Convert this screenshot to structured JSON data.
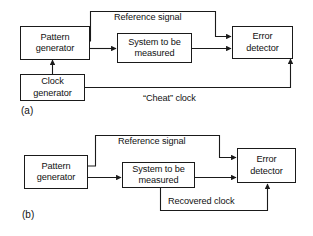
{
  "figure": {
    "title_visible": false,
    "panels": [
      {
        "id": "a",
        "label": "(a)",
        "blocks": [
          {
            "name": "pattern-generator",
            "lines": [
              "Pattern",
              "generator"
            ]
          },
          {
            "name": "system-under-test",
            "lines": [
              "System to be",
              "measured"
            ]
          },
          {
            "name": "error-detector",
            "lines": [
              "Error",
              "detector"
            ]
          },
          {
            "name": "clock-generator",
            "lines": [
              "Clock",
              "generator"
            ]
          }
        ],
        "edge_labels": [
          {
            "name": "reference-signal-label",
            "text": "Reference signal"
          },
          {
            "name": "cheat-clock-label",
            "text": "“Cheat” clock"
          }
        ]
      },
      {
        "id": "b",
        "label": "(b)",
        "blocks": [
          {
            "name": "pattern-generator",
            "lines": [
              "Pattern",
              "generator"
            ]
          },
          {
            "name": "system-under-test",
            "lines": [
              "System to be",
              "measured"
            ]
          },
          {
            "name": "error-detector",
            "lines": [
              "Error",
              "detector"
            ]
          }
        ],
        "edge_labels": [
          {
            "name": "reference-signal-label",
            "text": "Reference signal"
          },
          {
            "name": "recovered-clock-label",
            "text": "Recovered clock"
          }
        ]
      }
    ]
  },
  "colors": {
    "line": "#1a1a1a",
    "text": "#111111",
    "background": "#ffffff"
  }
}
